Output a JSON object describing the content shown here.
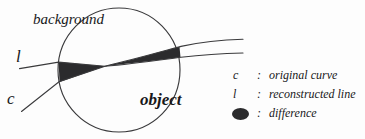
{
  "figure": {
    "labels": {
      "background": "background",
      "object": "object",
      "curve_c": "c",
      "line_l": "l"
    },
    "colors": {
      "stroke": "#2b2b2d",
      "difference_fill": "#2b2b2d",
      "background": "#fdfdfd"
    },
    "geometry": {
      "circle": {
        "cx": 119,
        "cy": 70,
        "r": 61
      },
      "crossing_point": {
        "x": 105,
        "y": 66
      },
      "curve_c_start": {
        "x": 22,
        "y": 111
      },
      "curve_c_end": {
        "x": 243,
        "y": 40
      },
      "line_l_start": {
        "x": 20,
        "y": 68
      },
      "line_l_end": {
        "x": 243,
        "y": 53
      }
    }
  },
  "legend": {
    "rows": [
      {
        "key": "c",
        "colon": ":",
        "text": "original curve",
        "icon": "none"
      },
      {
        "key": "l",
        "colon": ":",
        "text": "reconstructed line",
        "icon": "none"
      },
      {
        "key": "",
        "colon": ":",
        "text": "difference",
        "icon": "filled-ellipse"
      }
    ]
  }
}
